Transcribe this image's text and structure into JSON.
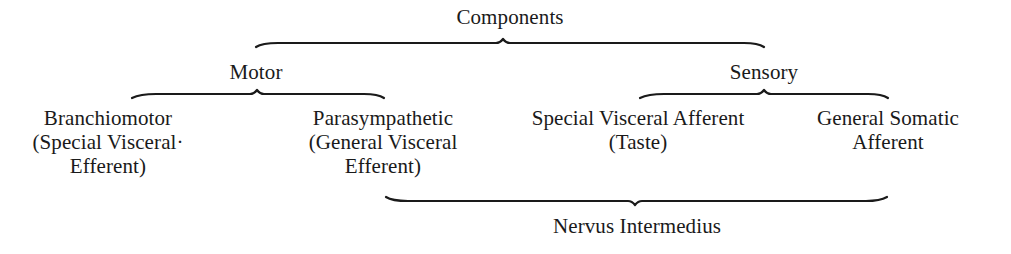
{
  "diagram": {
    "root": {
      "label": "Components"
    },
    "groups": [
      {
        "label": "Motor",
        "children": [
          {
            "lines": [
              "Branchiomotor",
              "(Special Visceral·",
              "Efferent)"
            ]
          },
          {
            "lines": [
              "Parasympathetic",
              "(General Visceral",
              "Efferent)"
            ]
          }
        ]
      },
      {
        "label": "Sensory",
        "children": [
          {
            "lines": [
              "Special Visceral Afferent",
              "(Taste)"
            ]
          },
          {
            "lines": [
              "General Somatic",
              "Afferent"
            ]
          }
        ]
      }
    ],
    "bottom_group": {
      "label": "Nervus Intermedius",
      "spans": [
        "Parasympathetic",
        "Special Visceral Afferent",
        "General Somatic Afferent"
      ]
    },
    "colors": {
      "ink": "#1a1a1a",
      "background": "#ffffff"
    }
  }
}
